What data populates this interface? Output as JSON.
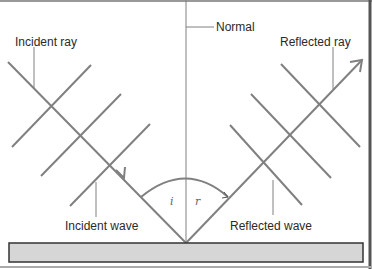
{
  "diagram": {
    "labels": {
      "normal": "Normal",
      "incident_ray": "Incident ray",
      "reflected_ray": "Reflected ray",
      "incident_wave": "Incident wave",
      "reflected_wave": "Reflected wave",
      "angle_incidence": "i",
      "angle_reflection": "r"
    },
    "colors": {
      "line": "#808080",
      "surface_fill": "#d6d6d6",
      "surface_border": "#333333",
      "text": "#2a2a2a",
      "background": "#ffffff"
    }
  }
}
